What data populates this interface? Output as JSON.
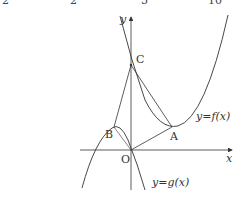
{
  "header_fragments": [
    "2",
    "5",
    "10"
  ],
  "axes": {
    "x_label": "x",
    "y_label": "y",
    "origin_label": "O"
  },
  "points": {
    "A": "A",
    "B": "B",
    "C": "C"
  },
  "curves": {
    "f_label": "y=f(x)",
    "g_label": "y=g(x)"
  },
  "colors": {
    "stroke": "#333333",
    "background": "#ffffff"
  }
}
